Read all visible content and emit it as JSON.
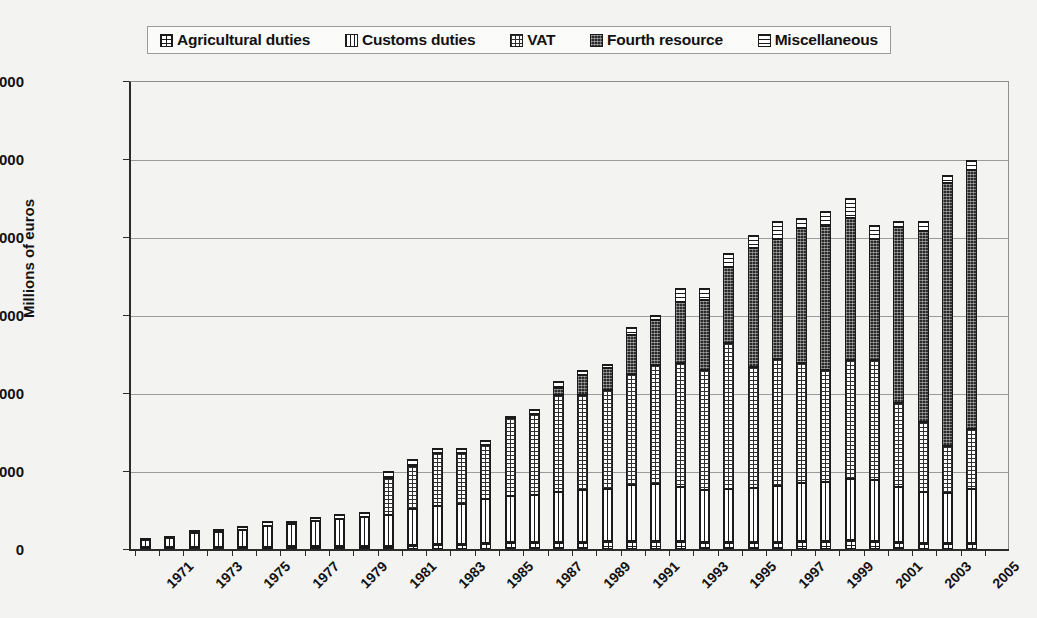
{
  "legend": {
    "items": [
      {
        "label": "Agricultural duties",
        "pattern": "p-agri",
        "icon": "grid-small-swatch-icon"
      },
      {
        "label": "Customs duties",
        "pattern": "p-customs",
        "icon": "vertical-lines-swatch-icon"
      },
      {
        "label": "VAT",
        "pattern": "p-vat",
        "icon": "grid-swatch-icon"
      },
      {
        "label": "Fourth resource",
        "pattern": "p-fourth",
        "icon": "dark-fill-swatch-icon"
      },
      {
        "label": "Miscellaneous",
        "pattern": "p-misc",
        "icon": "horizontal-lines-swatch-icon"
      }
    ]
  },
  "chart_data": {
    "type": "bar",
    "stacked": true,
    "title": "",
    "xlabel": "",
    "ylabel": "Millions of euros",
    "ylim": [
      0,
      120000
    ],
    "yticks": [
      0,
      20000,
      40000,
      60000,
      80000,
      100000,
      120000
    ],
    "ytick_labels": [
      "0",
      "20,000",
      "40,000",
      "60,000",
      "80,000",
      "100,000",
      "120,000"
    ],
    "grid": true,
    "legend_position": "top",
    "categories": [
      "1971",
      "1972",
      "1973",
      "1974",
      "1975",
      "1976",
      "1977",
      "1978",
      "1979",
      "1980",
      "1981",
      "1982",
      "1983",
      "1984",
      "1985",
      "1986",
      "1987",
      "1988",
      "1989",
      "1990",
      "1991",
      "1992",
      "1993",
      "1994",
      "1995",
      "1996",
      "1997",
      "1998",
      "1999",
      "2000",
      "2001",
      "2002",
      "2003",
      "2004",
      "2005"
    ],
    "tick_label_years": [
      "1971",
      "1973",
      "1975",
      "1977",
      "1979",
      "1981",
      "1983",
      "1985",
      "1987",
      "1989",
      "1991",
      "1993",
      "1995",
      "1997",
      "1999",
      "2001",
      "2003",
      "2005"
    ],
    "series": [
      {
        "name": "Agricultural duties",
        "pattern": "p-agri",
        "values": [
          300,
          350,
          450,
          500,
          550,
          600,
          650,
          700,
          750,
          800,
          900,
          1100,
          1300,
          1400,
          1500,
          1800,
          1700,
          1800,
          1900,
          2000,
          2100,
          2100,
          2000,
          1900,
          1800,
          1800,
          1900,
          2000,
          2100,
          2200,
          2000,
          1800,
          1600,
          1500,
          1500
        ]
      },
      {
        "name": "Customs duties",
        "pattern": "p-customs",
        "values": [
          1900,
          2300,
          3500,
          3800,
          4200,
          5400,
          5800,
          6400,
          6900,
          7400,
          7800,
          9200,
          9800,
          10100,
          11200,
          11900,
          12100,
          12800,
          13200,
          13500,
          14200,
          14500,
          13800,
          13200,
          13500,
          13800,
          14200,
          14800,
          15200,
          15800,
          15600,
          14200,
          13000,
          12800,
          13800
        ]
      },
      {
        "name": "VAT",
        "pattern": "p-vat",
        "values": [
          0,
          0,
          0,
          0,
          0,
          0,
          0,
          0,
          0,
          0,
          9500,
          11000,
          13500,
          13200,
          14000,
          20000,
          20800,
          24800,
          24500,
          25300,
          28500,
          30500,
          32000,
          30800,
          37500,
          31000,
          32500,
          31000,
          28500,
          30500,
          30800,
          21500,
          18000,
          12000,
          15500
        ]
      },
      {
        "name": "Fourth resource",
        "pattern": "p-fourth",
        "values": [
          0,
          0,
          0,
          0,
          0,
          0,
          0,
          0,
          0,
          0,
          0,
          0,
          0,
          0,
          0,
          0,
          0,
          2000,
          5000,
          5500,
          10000,
          11500,
          15500,
          18000,
          19500,
          30500,
          31000,
          34500,
          37000,
          36500,
          31000,
          45000,
          49000,
          67500,
          66500
        ]
      },
      {
        "name": "Miscellaneous",
        "pattern": "p-misc",
        "values": [
          100,
          250,
          750,
          700,
          1050,
          1200,
          700,
          1100,
          1350,
          1300,
          1800,
          1700,
          1400,
          1300,
          1300,
          300,
          1400,
          1600,
          1400,
          1200,
          2200,
          1400,
          3700,
          3100,
          3700,
          3500,
          4400,
          2700,
          4000,
          5000,
          3600,
          1500,
          2400,
          2200,
          2400
        ]
      }
    ],
    "totals": [
      2300,
      2900,
      4700,
      5000,
      5800,
      7200,
      7150,
      8200,
      9000,
      9500,
      20000,
      23000,
      26000,
      26000,
      28000,
      34000,
      36000,
      43000,
      46000,
      47500,
      57000,
      60000,
      67000,
      67000,
      76000,
      80600,
      84000,
      85000,
      86800,
      90000,
      83000,
      84000,
      84000,
      96000,
      99700
    ]
  }
}
